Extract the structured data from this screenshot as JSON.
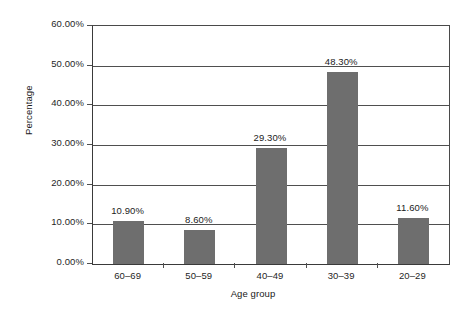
{
  "chart_data": {
    "type": "bar",
    "title": "",
    "xlabel": "Age group",
    "ylabel": "Percentage",
    "categories": [
      "60–69",
      "50–59",
      "40–49",
      "30–39",
      "20–29"
    ],
    "values": [
      10.9,
      8.6,
      29.3,
      48.3,
      11.6
    ],
    "value_labels": [
      "10.90%",
      "8.60%",
      "29.30%",
      "48.30%",
      "11.60%"
    ],
    "ylim": [
      0,
      60
    ],
    "ytick_values": [
      0,
      10,
      20,
      30,
      40,
      50,
      60
    ],
    "ytick_labels": [
      "0.00%",
      "10.00%",
      "20.00%",
      "30.00%",
      "40.00%",
      "50.00%",
      "60.00%"
    ],
    "grid": true,
    "legend": false,
    "bar_color": "#6e6e6e",
    "axis_color": "#4f4f4f",
    "background_color": "#ffffff"
  }
}
